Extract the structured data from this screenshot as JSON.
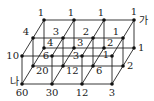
{
  "diagram": {
    "type": "3d-lattice-path-count",
    "dimensions": {
      "x_units": 3,
      "depth_units": 2,
      "height_units": 1
    },
    "start_label": "가",
    "end_label": "나",
    "layers": {
      "top": {
        "back": [
          "1",
          "1",
          "1",
          "1"
        ],
        "middle": [
          "4",
          "3",
          "2",
          "1"
        ],
        "front": [
          "10",
          "6",
          "3",
          "1"
        ]
      },
      "bottom": {
        "back": [
          "4",
          "3",
          "2",
          "1"
        ],
        "middle": [
          "20",
          "12",
          "6",
          "2"
        ],
        "front": [
          "60",
          "30",
          "12",
          "3"
        ]
      }
    }
  }
}
